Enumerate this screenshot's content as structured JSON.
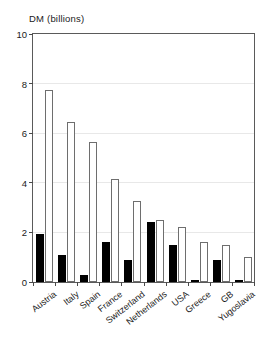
{
  "chart_data": {
    "type": "bar",
    "title": "DM (billions)",
    "subtitle": "",
    "xlabel": "",
    "ylabel": "DM (billions)",
    "ylim": [
      0,
      10
    ],
    "yticks": [
      0,
      2,
      4,
      6,
      8,
      10
    ],
    "ytick_labels": [
      "0",
      "2",
      "4",
      "6",
      "8",
      "10"
    ],
    "grid": true,
    "grid_axis": "y",
    "legend": "none",
    "legend_position": "none",
    "categories": [
      "Austria",
      "Italy",
      "Spain",
      "France",
      "Switzerland",
      "Netherlands",
      "USA",
      "Greece",
      "GB",
      "Yugoslavia"
    ],
    "series": [
      {
        "name": "filled",
        "color": "#000000",
        "style": "solid-black",
        "values": [
          1.95,
          1.1,
          0.3,
          1.6,
          0.9,
          2.4,
          1.5,
          0.1,
          0.9,
          0.1
        ]
      },
      {
        "name": "hollow",
        "color": "#ffffff",
        "style": "white-outlined",
        "values": [
          7.75,
          6.45,
          5.65,
          4.15,
          3.25,
          2.5,
          2.2,
          1.6,
          1.5,
          1.0
        ]
      }
    ]
  },
  "axes": {
    "frame_color": "#5a5a5a",
    "grid_color": "#e8e8e8",
    "tick_color": "#4a4a4a",
    "text_color": "#1a1a1a"
  }
}
